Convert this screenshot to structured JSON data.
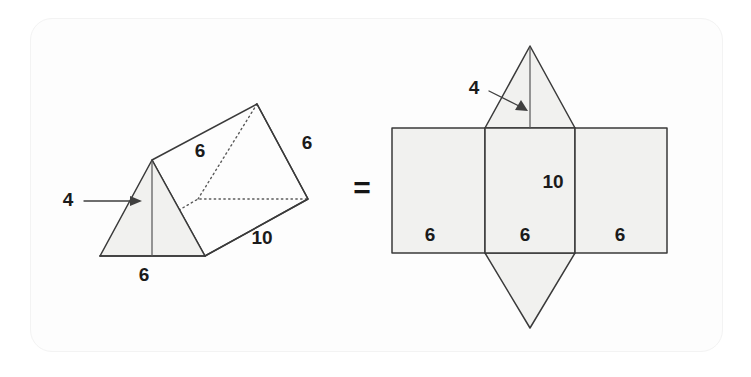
{
  "figure": {
    "relation_symbol": "=",
    "colors": {
      "face_fill": "#f1f1ef",
      "edge": "#3a3a3a",
      "hidden_edge": "#5a5a5a",
      "label_text": "#1b1b1b",
      "card_background": "#fdfdfd",
      "page_background": "#ffffff"
    },
    "solid": {
      "name": "triangular-prism",
      "labels": [
        {
          "id": "prism-height-4",
          "text": "4",
          "meaning": "triangle height",
          "x": 68,
          "y": 201
        },
        {
          "id": "prism-slant-6",
          "text": "6",
          "meaning": "top rectangular face width",
          "x": 200,
          "y": 152
        },
        {
          "id": "prism-right-6",
          "text": "6",
          "meaning": "right triangle side",
          "x": 307,
          "y": 144
        },
        {
          "id": "prism-length-10",
          "text": "10",
          "meaning": "prism length",
          "x": 260,
          "y": 239
        },
        {
          "id": "prism-base-6",
          "text": "6",
          "meaning": "triangle base",
          "x": 144,
          "y": 275
        }
      ]
    },
    "net": {
      "name": "prism-net",
      "labels": [
        {
          "id": "net-height-4",
          "text": "4",
          "meaning": "triangle height",
          "x": 474,
          "y": 89
        },
        {
          "id": "net-side-10",
          "text": "10",
          "meaning": "rectangle height",
          "x": 551,
          "y": 183
        },
        {
          "id": "net-left-6",
          "text": "6",
          "meaning": "left rectangle width",
          "x": 430,
          "y": 236
        },
        {
          "id": "net-mid-6",
          "text": "6",
          "meaning": "middle rectangle width",
          "x": 525,
          "y": 236
        },
        {
          "id": "net-right-6",
          "text": "6",
          "meaning": "right rectangle width",
          "x": 620,
          "y": 236
        }
      ]
    }
  }
}
